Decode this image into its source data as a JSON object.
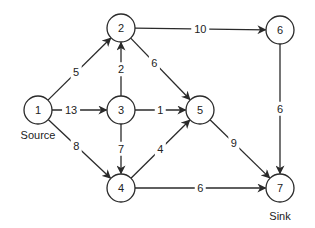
{
  "diagram": {
    "type": "directed-flow-network",
    "node_radius": 14,
    "stroke_color": "#2a2a2a",
    "nodes": [
      {
        "id": "1",
        "label": "1",
        "x": 38,
        "y": 110,
        "caption": "Source"
      },
      {
        "id": "2",
        "label": "2",
        "x": 121,
        "y": 28
      },
      {
        "id": "3",
        "label": "3",
        "x": 121,
        "y": 110
      },
      {
        "id": "4",
        "label": "4",
        "x": 121,
        "y": 188
      },
      {
        "id": "5",
        "label": "5",
        "x": 200,
        "y": 110
      },
      {
        "id": "6",
        "label": "6",
        "x": 280,
        "y": 30
      },
      {
        "id": "7",
        "label": "7",
        "x": 280,
        "y": 188,
        "caption": "Sink"
      }
    ],
    "edges": [
      {
        "from": "1",
        "to": "2",
        "capacity": "5",
        "label_t": 0.45
      },
      {
        "from": "1",
        "to": "3",
        "capacity": "13",
        "label_t": 0.35
      },
      {
        "from": "1",
        "to": "4",
        "capacity": "8",
        "label_t": 0.45
      },
      {
        "from": "3",
        "to": "2",
        "capacity": "2",
        "label_t": 0.5
      },
      {
        "from": "2",
        "to": "5",
        "capacity": "6",
        "label_t": 0.4
      },
      {
        "from": "2",
        "to": "6",
        "capacity": "10",
        "label_t": 0.5
      },
      {
        "from": "3",
        "to": "5",
        "capacity": "1",
        "label_t": 0.5
      },
      {
        "from": "3",
        "to": "4",
        "capacity": "7",
        "label_t": 0.5
      },
      {
        "from": "4",
        "to": "5",
        "capacity": "4",
        "label_t": 0.5
      },
      {
        "from": "5",
        "to": "7",
        "capacity": "9",
        "label_t": 0.4
      },
      {
        "from": "6",
        "to": "7",
        "capacity": "6",
        "label_t": 0.5
      },
      {
        "from": "4",
        "to": "7",
        "capacity": "6",
        "label_t": 0.5
      }
    ],
    "captions": {
      "source": "Source",
      "sink": "Sink"
    }
  }
}
